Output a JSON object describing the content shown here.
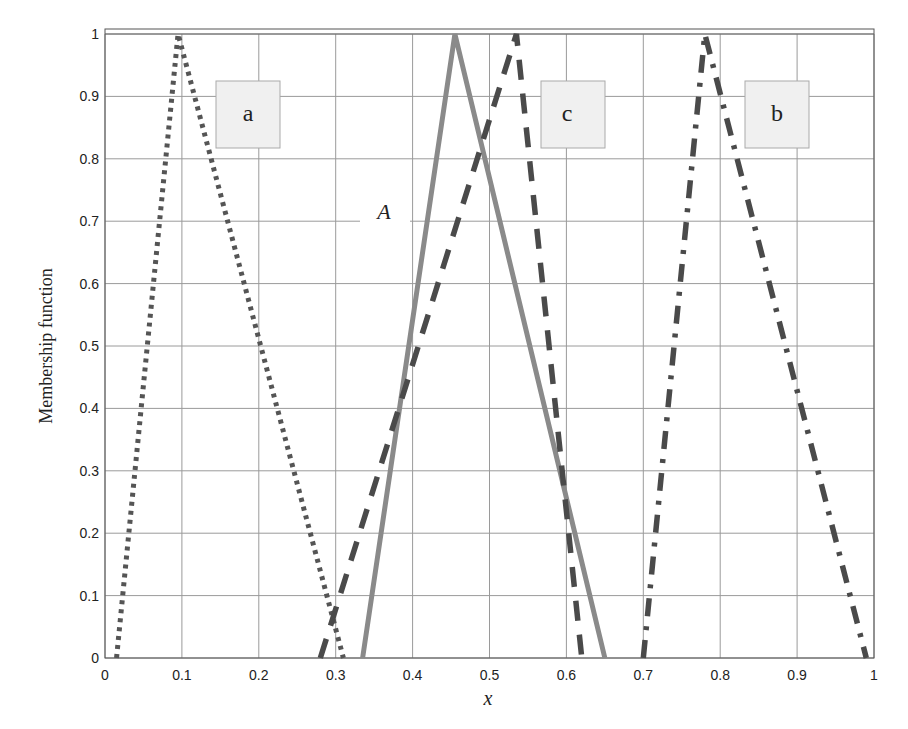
{
  "chart_data": {
    "type": "line",
    "title": "",
    "xlabel": "x",
    "ylabel": "Membership function",
    "xlim": [
      0,
      1
    ],
    "ylim": [
      0,
      1
    ],
    "grid": true,
    "xticks": [
      "0",
      "0.1",
      "0.2",
      "0.3",
      "0.4",
      "0.5",
      "0.6",
      "0.7",
      "0.8",
      "0.9",
      "1"
    ],
    "yticks": [
      "0",
      "0.1",
      "0.2",
      "0.3",
      "0.4",
      "0.5",
      "0.6",
      "0.7",
      "0.8",
      "0.9",
      "1"
    ],
    "series": [
      {
        "name": "a",
        "style": "dotted",
        "color": "#555555",
        "x": [
          0.015,
          0.095,
          0.31
        ],
        "y": [
          0,
          1,
          0
        ]
      },
      {
        "name": "A",
        "style": "solid",
        "color": "#8a8a8a",
        "x": [
          0.335,
          0.455,
          0.65
        ],
        "y": [
          0,
          1,
          0
        ]
      },
      {
        "name": "c",
        "style": "dashed",
        "color": "#4a4a4a",
        "x": [
          0.28,
          0.535,
          0.62
        ],
        "y": [
          0,
          1,
          0
        ]
      },
      {
        "name": "b",
        "style": "dash-dot",
        "color": "#4a4a4a",
        "x": [
          0.7,
          0.78,
          0.99
        ],
        "y": [
          0,
          1,
          0
        ]
      }
    ],
    "annotations": [
      {
        "text": "a",
        "boxed": true,
        "x": 0.18,
        "y": 0.88
      },
      {
        "text": "c",
        "boxed": true,
        "x": 0.6,
        "y": 0.88
      },
      {
        "text": "b",
        "boxed": true,
        "x": 0.875,
        "y": 0.88
      },
      {
        "text": "A",
        "boxed": false,
        "italic": true,
        "x": 0.36,
        "y": 0.72
      }
    ]
  },
  "labels": {
    "xlabel": "x",
    "ylabel": "Membership function",
    "box_a": "a",
    "box_c": "c",
    "box_b": "b",
    "curve_A": "A"
  }
}
